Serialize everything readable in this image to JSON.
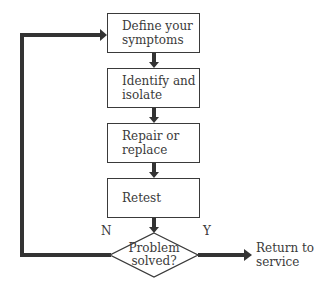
{
  "diagram": {
    "type": "flowchart",
    "steps": [
      {
        "id": "define",
        "label": "Define your\nsymptoms"
      },
      {
        "id": "identify",
        "label": "Identify and\nisolate"
      },
      {
        "id": "repair",
        "label": "Repair or\nreplace"
      },
      {
        "id": "retest",
        "label": "Retest"
      }
    ],
    "decision": {
      "label": "Problem\nsolved?",
      "no_label": "N",
      "yes_label": "Y"
    },
    "outcome": {
      "label": "Return to\nservice"
    },
    "colors": {
      "line": "#3a3a3a",
      "background": "#ffffff"
    }
  }
}
